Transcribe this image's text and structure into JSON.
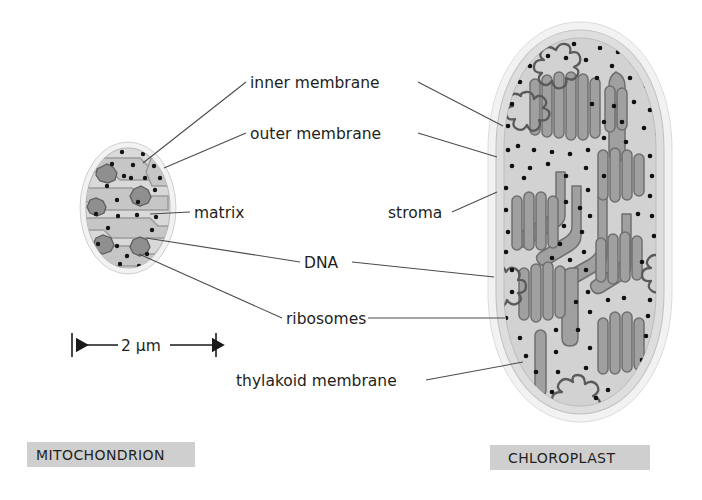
{
  "figure": {
    "type": "biology-diagram",
    "title_left": "MITOCHONDRION",
    "title_right": "CHLOROPLAST",
    "background_color": "#ffffff",
    "ink_color": "#231f20",
    "caption_box_color": "#cfcfcf"
  },
  "labels": {
    "inner_membrane": "inner membrane",
    "outer_membrane": "outer membrane",
    "matrix": "matrix",
    "dna": "DNA",
    "ribosomes": "ribosomes",
    "stroma": "stroma",
    "thylakoid_membrane": "thylakoid membrane"
  },
  "scale": {
    "value": "2 µm",
    "x_start": 72,
    "x_end": 216,
    "y": 345
  },
  "organelles": {
    "mitochondrion": {
      "name": "mitochondrion",
      "center_x": 128,
      "center_y": 208,
      "rx": 48,
      "ry": 66,
      "outer_membrane_color": "#ececec",
      "inner_space_color": "#d4d4d4",
      "matrix_color": "#c2c2c2",
      "cristae_color": "#bdbdbd",
      "ribosome_color": "#1a1a1a",
      "dna_color": "#7a7a7a",
      "feature_counts": {
        "cristae": 5,
        "dna_clusters": 4,
        "ribosomes": 26
      }
    },
    "chloroplast": {
      "name": "chloroplast",
      "center_x": 580,
      "center_y": 222,
      "rx": 86,
      "ry": 198,
      "outer_membrane_color": "#ececec",
      "inner_space_color": "#d8d8d8",
      "stroma_color": "#cccccc",
      "thylakoid_color": "#9b9b9b",
      "thylakoid_stroke": "#6e6e6e",
      "ribosome_color": "#111111",
      "dna_color": "#5f5f5f",
      "feature_counts": {
        "grana_stacks": 7,
        "dna_loops": 4,
        "ribosomes": 120
      }
    }
  },
  "leaders": [
    {
      "label": "inner_membrane",
      "side": "left",
      "target_x": 143,
      "target_y": 163
    },
    {
      "label": "inner_membrane",
      "side": "right",
      "target_x": 503,
      "target_y": 126
    },
    {
      "label": "outer_membrane",
      "side": "left",
      "target_x": 164,
      "target_y": 168
    },
    {
      "label": "outer_membrane",
      "side": "right",
      "target_x": 497,
      "target_y": 157
    },
    {
      "label": "matrix",
      "side": "left",
      "target_x": 150,
      "target_y": 214
    },
    {
      "label": "dna",
      "side": "left",
      "target_x": 146,
      "target_y": 238
    },
    {
      "label": "dna",
      "side": "right",
      "target_x": 494,
      "target_y": 277
    },
    {
      "label": "ribosomes",
      "side": "left",
      "target_x": 139,
      "target_y": 254
    },
    {
      "label": "ribosomes",
      "side": "right",
      "target_x": 505,
      "target_y": 318
    },
    {
      "label": "stroma",
      "side": "right",
      "target_x": 497,
      "target_y": 192
    },
    {
      "label": "thylakoid_membrane",
      "side": "right",
      "target_x": 523,
      "target_y": 362
    }
  ]
}
